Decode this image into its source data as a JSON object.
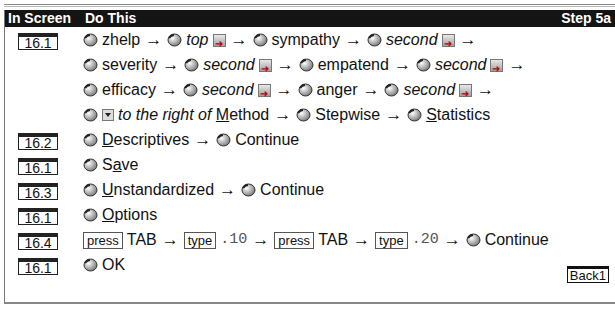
{
  "header": {
    "col1": "In Screen",
    "col2": "Do This",
    "step": "Step 5a"
  },
  "rows": [
    {
      "screen": "16.1"
    },
    {
      "screen": "16.2"
    },
    {
      "screen": "16.1"
    },
    {
      "screen": "16.3"
    },
    {
      "screen": "16.1"
    },
    {
      "screen": "16.4"
    },
    {
      "screen": "16.1"
    }
  ],
  "lines": {
    "l1": {
      "a": "zhelp",
      "b": "top",
      "c": "sympathy",
      "d": "second"
    },
    "l2": {
      "a": "severity",
      "b": "second",
      "c": "empatend",
      "d": "second"
    },
    "l3": {
      "a": "efficacy",
      "b": "second",
      "c": "anger",
      "d": "second"
    },
    "l4": {
      "a": "to the right of ",
      "m": "M",
      "m_rest": "ethod",
      "b": "Stepwise",
      "c_u": "S",
      "c_rest": "tatistics"
    },
    "l5": {
      "a_u": "D",
      "a_rest": "escriptives",
      "b": "Continue"
    },
    "l6": {
      "a1": "S",
      "a_u": "a",
      "a_rest": "ve"
    },
    "l7": {
      "a_u": "U",
      "a_rest": "nstandardized",
      "b": "Continue"
    },
    "l8": {
      "a_u": "O",
      "a_rest": "ptions"
    },
    "l9": {
      "press": "press",
      "tab": "TAB",
      "type": "type",
      "v1": ".10",
      "v2": ".20",
      "b": "Continue"
    },
    "l10": {
      "a": "OK"
    }
  },
  "icons": {
    "mouse": "mouse-click-icon",
    "button": "arrow-button-icon",
    "dropdown": "dropdown-icon",
    "arrow": "→"
  },
  "back_label": "Back1"
}
